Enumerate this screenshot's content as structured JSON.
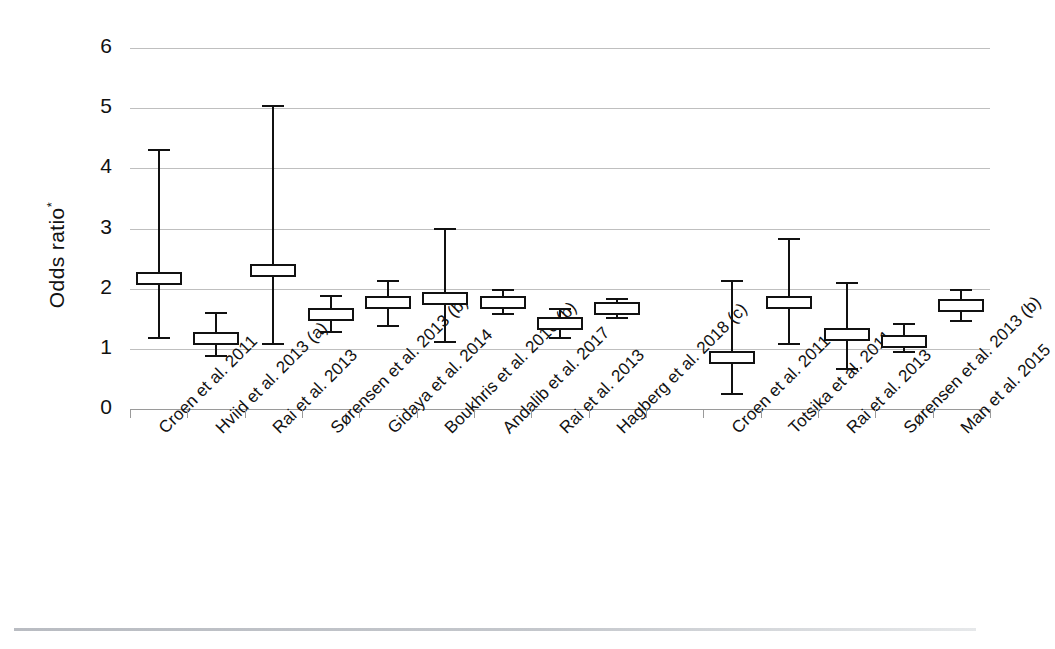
{
  "chart_data": {
    "type": "scatter",
    "title": "",
    "subtitle": "",
    "xlabel": "",
    "ylabel": "Odds ratio*",
    "ylabel_plain": "Odds ratio",
    "ylabel_footnote": "*",
    "ylim": [
      0,
      6
    ],
    "yticks": [
      0,
      1,
      2,
      3,
      4,
      5,
      6
    ],
    "ytick_labels": [
      "0",
      "1",
      "2",
      "3",
      "4",
      "5",
      "6"
    ],
    "grid": true,
    "grid_axis": "y",
    "legend": "none",
    "marker_style": "open-rectangle-with-error-bars",
    "series_color": "#111111",
    "gridline_color": "#bfbfbf",
    "background_color": "#ffffff",
    "gap_after_index": 8,
    "categories": [
      "Croen et al. 2011",
      "Hviid et al. 2013 (a)",
      "Rai et al. 2013",
      "Sørensen et al. 2013 (b)",
      "Gidaya et al. 2014",
      "Boukhris et al. 2016 (b)",
      "Andalib et al. 2017",
      "Rai et al. 2013",
      "Hagberg et al. 2018 (c)",
      "Croen et al. 2011",
      "Totsika et al. 2011",
      "Rai et al. 2013",
      "Sørensen et al. 2013 (b)",
      "Man et al. 2015"
    ],
    "values": [
      2.17,
      1.18,
      2.31,
      1.57,
      1.77,
      1.83,
      1.77,
      1.42,
      1.67,
      0.85,
      1.77,
      1.23,
      1.13,
      1.72
    ],
    "ci_lower": [
      1.18,
      0.88,
      1.08,
      1.28,
      1.38,
      1.12,
      1.58,
      1.18,
      1.52,
      0.25,
      1.08,
      0.67,
      0.95,
      1.47
    ],
    "ci_upper": [
      4.3,
      1.6,
      5.03,
      1.87,
      2.12,
      3.0,
      1.98,
      1.67,
      1.83,
      2.12,
      2.82,
      2.1,
      1.42,
      1.97
    ],
    "points": [
      {
        "label": "Croen et al. 2011",
        "value": 2.17,
        "low": 1.18,
        "high": 4.3
      },
      {
        "label": "Hviid et al. 2013 (a)",
        "value": 1.18,
        "low": 0.88,
        "high": 1.6
      },
      {
        "label": "Rai et al. 2013",
        "value": 2.31,
        "low": 1.08,
        "high": 5.03
      },
      {
        "label": "Sørensen et al. 2013 (b)",
        "value": 1.57,
        "low": 1.28,
        "high": 1.87
      },
      {
        "label": "Gidaya et al. 2014",
        "value": 1.77,
        "low": 1.38,
        "high": 2.12
      },
      {
        "label": "Boukhris et al. 2016 (b)",
        "value": 1.83,
        "low": 1.12,
        "high": 3.0
      },
      {
        "label": "Andalib et al. 2017",
        "value": 1.77,
        "low": 1.58,
        "high": 1.98
      },
      {
        "label": "Rai et al. 2013",
        "value": 1.42,
        "low": 1.18,
        "high": 1.67
      },
      {
        "label": "Hagberg et al. 2018 (c)",
        "value": 1.67,
        "low": 1.52,
        "high": 1.83
      },
      {
        "label": "Croen et al. 2011",
        "value": 0.85,
        "low": 0.25,
        "high": 2.12
      },
      {
        "label": "Totsika et al. 2011",
        "value": 1.77,
        "low": 1.08,
        "high": 2.82
      },
      {
        "label": "Rai et al. 2013",
        "value": 1.23,
        "low": 0.67,
        "high": 2.1
      },
      {
        "label": "Sørensen et al. 2013 (b)",
        "value": 1.13,
        "low": 0.95,
        "high": 1.42
      },
      {
        "label": "Man et al. 2015",
        "value": 1.72,
        "low": 1.47,
        "high": 1.97
      }
    ]
  }
}
